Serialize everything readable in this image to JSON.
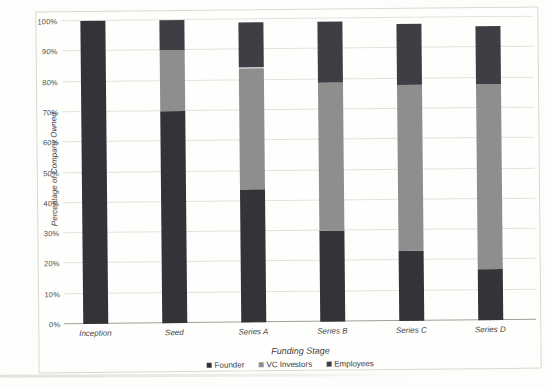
{
  "chart_data": {
    "type": "bar",
    "stacked": true,
    "xlabel": "Funding Stage",
    "ylabel": "Percentage of Company Owned",
    "categories": [
      "Inception",
      "Seed",
      "Series A",
      "Series B",
      "Series C",
      "Series D"
    ],
    "series": [
      {
        "name": "Founder",
        "color": "#333338",
        "values": [
          100,
          70,
          44,
          30,
          23,
          17
        ]
      },
      {
        "name": "VC Investors",
        "color": "#8e8e8e",
        "values": [
          0,
          20,
          40,
          49,
          55,
          61
        ]
      },
      {
        "name": "Employees",
        "color": "#3e3e45",
        "values": [
          0,
          10,
          15,
          20,
          20,
          19
        ]
      }
    ],
    "stack_totals": [
      100,
      100,
      99,
      99,
      98,
      97
    ],
    "y_ticks": [
      "0%",
      "10%",
      "20%",
      "30%",
      "40%",
      "50%",
      "60%",
      "70%",
      "80%",
      "90%",
      "100%"
    ],
    "ylim": [
      0,
      100
    ],
    "grid": true,
    "legend_position": "bottom"
  },
  "style_colors": {
    "frame_border": "#d9d9d4",
    "gridline": "#e2e2dd",
    "axis_line": "#9f9f9a",
    "tick_text": "#4c4c4c",
    "title_text": "#3f3f3f",
    "background": "#fdfdfc"
  }
}
